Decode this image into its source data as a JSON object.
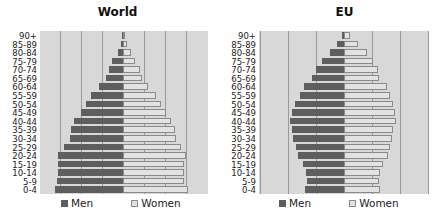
{
  "chart_data": [
    {
      "type": "bar",
      "orientation": "horizontal-pyramid",
      "title": "World",
      "xlabel": "",
      "ylabel": "",
      "grid": true,
      "legend_position": "bottom",
      "categories": [
        "90+",
        "85-89",
        "80-84",
        "75-79",
        "70-74",
        "65-69",
        "60-64",
        "55-59",
        "50-54",
        "45-49",
        "40-44",
        "35-39",
        "30-34",
        "25-29",
        "20-24",
        "15-19",
        "10-14",
        "5-9",
        "0-4"
      ],
      "series": [
        {
          "name": "Men",
          "color": "#5e5e5e",
          "values": [
            0.1,
            0.2,
            0.5,
            1.0,
            1.3,
            1.6,
            2.3,
            3.0,
            3.5,
            4.0,
            4.6,
            4.9,
            5.0,
            5.6,
            6.1,
            6.1,
            6.1,
            6.2,
            6.4
          ]
        },
        {
          "name": "Women",
          "color": "#e2e2e2",
          "values": [
            0.1,
            0.4,
            0.8,
            1.1,
            1.6,
            1.8,
            2.4,
            3.1,
            3.6,
            4.1,
            4.5,
            4.9,
            5.0,
            5.5,
            5.9,
            5.8,
            5.8,
            5.8,
            6.1
          ]
        }
      ],
      "xlim": [
        -8,
        8
      ]
    },
    {
      "type": "bar",
      "orientation": "horizontal-pyramid",
      "title": "EU",
      "xlabel": "",
      "ylabel": "",
      "grid": true,
      "legend_position": "bottom",
      "categories": [
        "90+",
        "85-89",
        "80-84",
        "75-79",
        "70-74",
        "65-69",
        "60-64",
        "55-59",
        "50-54",
        "45-49",
        "40-44",
        "35-39",
        "30-34",
        "25-29",
        "20-24",
        "15-19",
        "10-14",
        "5-9",
        "0-4"
      ],
      "series": [
        {
          "name": "Men",
          "color": "#5e5e5e",
          "values": [
            0.2,
            0.7,
            1.4,
            2.2,
            2.8,
            3.2,
            4.0,
            4.4,
            4.9,
            5.2,
            5.4,
            5.2,
            5.1,
            4.8,
            4.6,
            4.1,
            3.8,
            3.7,
            3.9
          ]
        },
        {
          "name": "Women",
          "color": "#e2e2e2",
          "values": [
            0.6,
            1.4,
            2.3,
            2.9,
            3.4,
            3.5,
            4.3,
            4.6,
            4.9,
            5.1,
            5.2,
            4.9,
            4.8,
            4.6,
            4.4,
            3.9,
            3.6,
            3.5,
            3.6
          ]
        }
      ],
      "xlim": [
        -8.5,
        8.5
      ]
    }
  ],
  "charts": {
    "world": {
      "title": "World",
      "legend": {
        "men": "Men",
        "women": "Women"
      }
    },
    "eu": {
      "title": "EU",
      "legend": {
        "men": "Men",
        "women": "Women"
      }
    }
  }
}
